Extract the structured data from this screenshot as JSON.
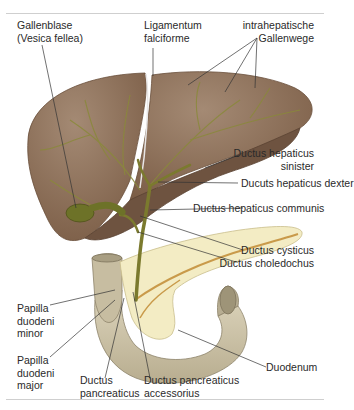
{
  "figure": {
    "colors": {
      "liver": "#8a6a52",
      "liver_underside": "#6e5340",
      "bile_duct": "#7b7a2e",
      "gallbladder": "#6d7228",
      "pancreas": "#f3ecc4",
      "duodenum": "#cfc6ac",
      "leader_line": "#333333"
    },
    "labels": {
      "gallenblase_1": "Gallenblase",
      "gallenblase_2": "(Vesica fellea)",
      "lig_1": "Ligamentum",
      "lig_2": "falciforme",
      "intra_1": "intrahepatische",
      "intra_2": "Gallenwege",
      "dhs_1": "Ductus hepaticus",
      "dhs_2": "sinister",
      "dhd": "Ducuts hepaticus dexter",
      "dhc": "Ductus hepaticus communis",
      "dcys": "Ductus cysticus",
      "dchol": "Ductus choledochus",
      "pmin_1": "Papilla",
      "pmin_2": "duodeni",
      "pmin_3": "minor",
      "pmaj_1": "Papilla",
      "pmaj_2": "duodeni",
      "pmaj_3": "major",
      "dp_1": "Ductus",
      "dp_2": "pancreaticus",
      "dpa_1": "Ductus pancreaticus",
      "dpa_2": "accessorius",
      "duod": "Duodenum"
    }
  }
}
